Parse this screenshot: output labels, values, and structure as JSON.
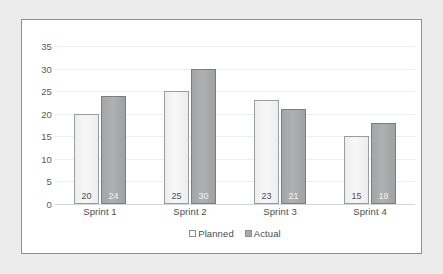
{
  "chart_data": {
    "type": "bar",
    "title": "",
    "subtitle": "",
    "xlabel": "",
    "ylabel": "",
    "categories": [
      "Sprint 1",
      "Sprint 2",
      "Sprint 3",
      "Sprint 4"
    ],
    "series": [
      {
        "name": "Planned",
        "values": [
          20,
          25,
          23,
          15
        ],
        "color": "#f2f2f2",
        "border_color": "#9a9d9f"
      },
      {
        "name": "Actual",
        "values": [
          24,
          30,
          21,
          18
        ],
        "color": "#a6a8aa",
        "border_color": "#7b7e80"
      }
    ],
    "ylim": [
      0,
      35
    ],
    "ytick_step": 5,
    "yticks": [
      35,
      30,
      25,
      20,
      15,
      10,
      5,
      0
    ],
    "grid": true,
    "grid_axis": "y",
    "legend_position": "bottom",
    "data_labels": true
  },
  "axes": {
    "y_ticks": [
      "35",
      "30",
      "25",
      "20",
      "15",
      "10",
      "5",
      "0"
    ],
    "x_ticks": [
      "Sprint 1",
      "Sprint 2",
      "Sprint 3",
      "Sprint 4"
    ]
  },
  "legend": {
    "items": [
      {
        "label": "Planned",
        "swatch": "square-outline-light"
      },
      {
        "label": "Actual",
        "swatch": "square-filled-gray"
      }
    ]
  },
  "bars": [
    {
      "group": "Sprint 1",
      "series": "Planned",
      "value": 20,
      "label": "20"
    },
    {
      "group": "Sprint 1",
      "series": "Actual",
      "value": 24,
      "label": "24"
    },
    {
      "group": "Sprint 2",
      "series": "Planned",
      "value": 25,
      "label": "25"
    },
    {
      "group": "Sprint 2",
      "series": "Actual",
      "value": 30,
      "label": "30"
    },
    {
      "group": "Sprint 3",
      "series": "Planned",
      "value": 23,
      "label": "23"
    },
    {
      "group": "Sprint 3",
      "series": "Actual",
      "value": 21,
      "label": "21"
    },
    {
      "group": "Sprint 4",
      "series": "Planned",
      "value": 15,
      "label": "15"
    },
    {
      "group": "Sprint 4",
      "series": "Actual",
      "value": 18,
      "label": "18"
    }
  ],
  "colors": {
    "frame_border": "#8e9193",
    "page_background": "#ececed",
    "plot_background": "#ffffff",
    "gridline": "#eceded",
    "baseline": "#d3d5d6",
    "tick_text": "#4d4d4d"
  }
}
